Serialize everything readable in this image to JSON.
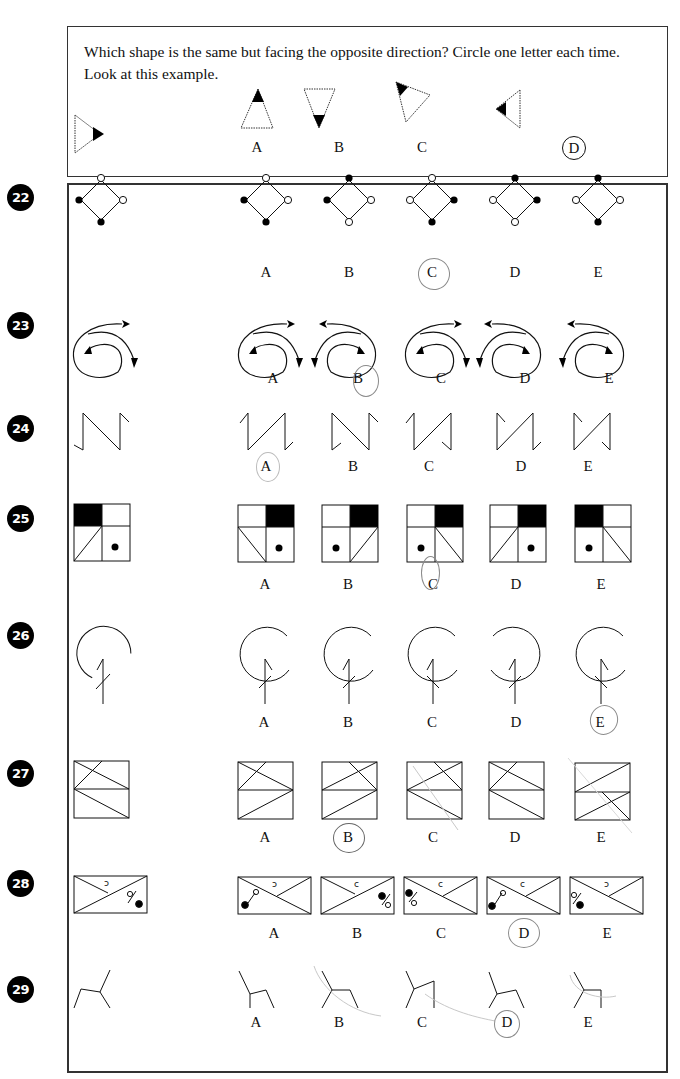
{
  "instructions": {
    "text": "Which shape is the same but facing the opposite direction? Circle one letter each time. Look at this example."
  },
  "example": {
    "options": [
      "A",
      "B",
      "C",
      "D"
    ],
    "circled_answer": "D"
  },
  "questions": [
    {
      "number": "22",
      "shape": "diamond with dots",
      "options": [
        "A",
        "B",
        "C",
        "D",
        "E"
      ],
      "pencil_circled": "C"
    },
    {
      "number": "23",
      "shape": "spiral arrows",
      "options": [
        "A",
        "B",
        "C",
        "D",
        "E"
      ],
      "pencil_circled": "B"
    },
    {
      "number": "24",
      "shape": "zigzag N",
      "options": [
        "A",
        "B",
        "C",
        "D",
        "E"
      ],
      "pencil_circled": "A"
    },
    {
      "number": "25",
      "shape": "square grid with black cell and dot",
      "options": [
        "A",
        "B",
        "C",
        "D",
        "E"
      ],
      "pencil_circled": "C"
    },
    {
      "number": "26",
      "shape": "open circle with stem",
      "options": [
        "A",
        "B",
        "C",
        "D",
        "E"
      ],
      "pencil_circled": "E"
    },
    {
      "number": "27",
      "shape": "rectangle with diagonals",
      "options": [
        "A",
        "B",
        "C",
        "D",
        "E"
      ],
      "pencil_circled": "B"
    },
    {
      "number": "28",
      "shape": "envelope with percent sign",
      "options": [
        "A",
        "B",
        "C",
        "D",
        "E"
      ],
      "pencil_circled": "D"
    },
    {
      "number": "29",
      "shape": "branching lines",
      "options": [
        "A",
        "B",
        "C",
        "D",
        "E"
      ],
      "pencil_circled": "D"
    }
  ],
  "colors": {
    "ink": "#111111",
    "badge": "#000000",
    "pencil": "#8a8a8a"
  }
}
